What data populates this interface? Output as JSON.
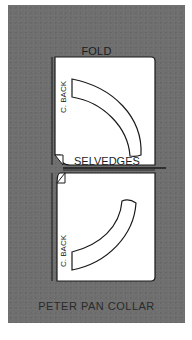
{
  "diagram": {
    "type": "sewing-pattern-layout",
    "fold_label": "FOLD",
    "selvedges_label": "SELVEDGES",
    "title": "PETER PAN COLLAR",
    "pieces": [
      {
        "label": "C. BACK",
        "position": "upper",
        "orientation": "upright"
      },
      {
        "label": "C. BACK",
        "position": "lower",
        "orientation": "mirrored"
      }
    ],
    "colors": {
      "background": "#6f6f6f",
      "fabric": "#ffffff",
      "outline": "#1a1a1a",
      "text": "#1c1c1c"
    }
  }
}
